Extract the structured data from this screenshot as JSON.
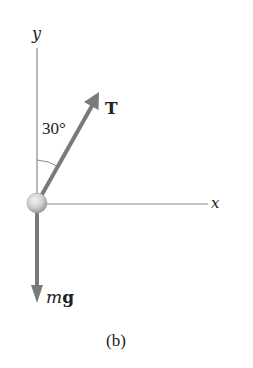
{
  "diagram": {
    "caption": "(b)",
    "axes": {
      "y_label": "y",
      "x_label": "x"
    },
    "angle": {
      "label": "30°",
      "degrees": 30
    },
    "forces": {
      "tension": {
        "label": "T",
        "color": "#7a7a7a"
      },
      "weight": {
        "label_italic": "m",
        "label_bold": "g",
        "color": "#7a7a7a"
      }
    },
    "colors": {
      "axis": "#8a8a8a",
      "arrow": "#7a7a7a",
      "ball_light": "#f2f2f2",
      "ball_dark": "#a8a8a8",
      "text": "#222222"
    }
  }
}
